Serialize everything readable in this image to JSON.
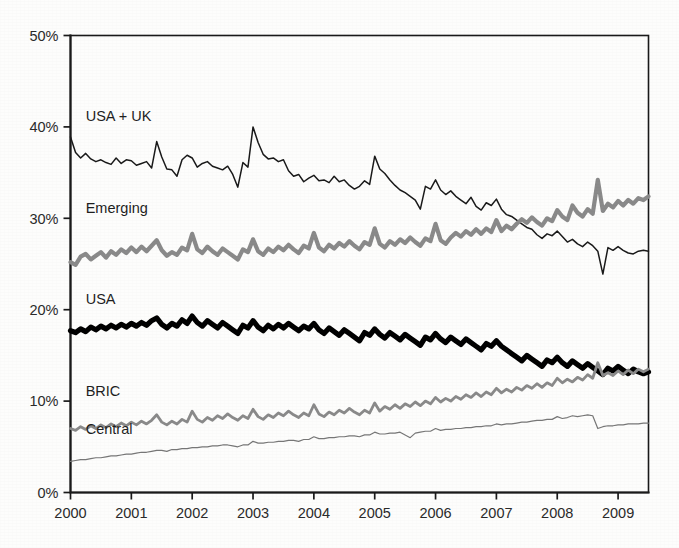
{
  "chart_data": {
    "type": "line",
    "title": "",
    "subtitle": "",
    "xlabel": "",
    "ylabel": "",
    "xlim": [
      2000.0,
      2009.5
    ],
    "ylim": [
      0,
      50
    ],
    "yunit": "%",
    "grid": false,
    "legend_position": "inline-left-labels",
    "y_ticks": [
      "0%",
      "10%",
      "20%",
      "30%",
      "40%",
      "50%"
    ],
    "y_tick_values": [
      0,
      10,
      20,
      30,
      40,
      50
    ],
    "x_ticks": [
      "2000",
      "2001",
      "2002",
      "2003",
      "2004",
      "2005",
      "2006",
      "2007",
      "2008",
      "2009"
    ],
    "x_tick_values": [
      2000,
      2001,
      2002,
      2003,
      2004,
      2005,
      2006,
      2007,
      2008,
      2009
    ],
    "series": [
      {
        "name": "USA + UK",
        "label": "USA + UK",
        "color": "#1a1a1a",
        "stroke_width": 1.5,
        "label_x": 2000.25,
        "label_y": 40.6,
        "values": [
          38.9,
          37.2,
          36.6,
          37.1,
          36.5,
          36.2,
          36.4,
          36.1,
          35.9,
          36.6,
          36.0,
          36.4,
          36.3,
          35.8,
          36.0,
          36.2,
          35.5,
          38.4,
          36.7,
          35.4,
          35.3,
          34.6,
          36.4,
          36.9,
          36.6,
          35.6,
          36.0,
          36.2,
          35.7,
          35.5,
          35.3,
          35.7,
          34.8,
          33.4,
          36.1,
          35.6,
          40.0,
          38.3,
          37.0,
          36.5,
          36.6,
          36.2,
          36.4,
          35.2,
          34.6,
          34.8,
          34.0,
          34.4,
          34.7,
          34.1,
          34.2,
          33.9,
          34.6,
          34.0,
          34.2,
          33.6,
          33.2,
          33.5,
          34.1,
          33.7,
          36.8,
          35.4,
          34.9,
          34.2,
          33.6,
          33.1,
          32.8,
          32.4,
          32.0,
          31.0,
          33.5,
          33.2,
          34.2,
          33.1,
          32.6,
          33.0,
          32.4,
          32.0,
          31.6,
          32.3,
          31.3,
          30.9,
          31.7,
          31.4,
          32.1,
          31.0,
          30.4,
          30.2,
          29.8,
          29.4,
          29.0,
          28.8,
          28.2,
          27.8,
          28.3,
          28.1,
          28.6,
          28.0,
          27.4,
          27.7,
          27.2,
          26.9,
          27.4,
          27.0,
          26.4,
          23.9,
          26.8,
          26.5,
          26.9,
          26.5,
          26.2,
          26.1,
          26.4,
          26.5,
          26.4
        ]
      },
      {
        "name": "Emerging",
        "label": "Emerging",
        "color": "#8a8a8a",
        "stroke_width": 4.2,
        "label_x": 2000.25,
        "label_y": 30.6,
        "values": [
          25.2,
          24.9,
          25.8,
          26.1,
          25.5,
          25.9,
          26.3,
          25.7,
          26.4,
          26.0,
          26.6,
          26.2,
          26.8,
          26.3,
          26.9,
          26.4,
          27.0,
          27.6,
          26.5,
          25.9,
          26.3,
          26.0,
          26.8,
          26.5,
          28.3,
          26.6,
          26.2,
          26.9,
          26.4,
          26.0,
          26.7,
          26.3,
          25.9,
          25.5,
          26.6,
          26.3,
          27.7,
          26.4,
          26.0,
          26.7,
          26.3,
          26.9,
          26.5,
          27.1,
          26.6,
          26.2,
          27.0,
          26.7,
          28.4,
          26.8,
          26.4,
          27.1,
          26.7,
          27.3,
          26.9,
          27.5,
          27.0,
          26.6,
          27.4,
          27.1,
          28.9,
          27.2,
          26.8,
          27.5,
          27.1,
          27.7,
          27.3,
          27.9,
          27.4,
          27.0,
          27.8,
          27.5,
          29.4,
          27.6,
          27.2,
          27.9,
          28.4,
          28.0,
          28.6,
          28.2,
          28.8,
          28.3,
          28.9,
          28.5,
          29.8,
          28.6,
          29.2,
          28.8,
          29.4,
          29.9,
          29.5,
          30.1,
          29.6,
          29.2,
          30.0,
          29.7,
          30.9,
          30.2,
          29.8,
          31.4,
          30.6,
          30.2,
          31.0,
          30.5,
          34.2,
          30.8,
          31.6,
          31.2,
          31.9,
          31.4,
          32.0,
          31.6,
          32.2,
          32.0,
          32.4
        ]
      },
      {
        "name": "USA",
        "label": "USA",
        "color": "#000000",
        "stroke_width": 5.2,
        "label_x": 2000.25,
        "label_y": 20.6,
        "values": [
          17.7,
          17.5,
          17.9,
          17.6,
          18.1,
          17.8,
          18.2,
          17.9,
          18.3,
          18.0,
          18.4,
          18.1,
          18.5,
          18.2,
          18.6,
          18.3,
          18.8,
          19.1,
          18.4,
          18.0,
          18.5,
          18.2,
          18.9,
          18.5,
          19.3,
          18.6,
          18.2,
          18.8,
          18.4,
          18.0,
          18.6,
          18.2,
          17.8,
          17.4,
          18.3,
          18.0,
          18.8,
          18.1,
          17.7,
          18.3,
          17.9,
          18.4,
          18.0,
          18.5,
          18.1,
          17.7,
          18.2,
          17.9,
          18.5,
          17.8,
          17.4,
          18.0,
          17.6,
          17.2,
          17.8,
          17.4,
          17.0,
          16.6,
          17.5,
          17.2,
          17.9,
          17.3,
          16.9,
          17.5,
          17.1,
          16.7,
          17.3,
          16.9,
          16.5,
          16.1,
          17.0,
          16.7,
          17.4,
          16.8,
          16.4,
          17.0,
          16.6,
          16.2,
          16.8,
          16.4,
          16.0,
          15.6,
          16.3,
          16.0,
          16.6,
          16.0,
          15.6,
          15.2,
          14.8,
          14.4,
          15.0,
          14.6,
          14.2,
          13.8,
          14.5,
          14.2,
          14.8,
          14.2,
          13.8,
          14.4,
          14.0,
          13.6,
          14.1,
          13.7,
          13.3,
          12.9,
          13.6,
          13.3,
          13.8,
          13.4,
          13.0,
          13.5,
          13.2,
          13.0,
          13.2
        ]
      },
      {
        "name": "BRIC",
        "label": "BRIC",
        "color": "#8a8a8a",
        "stroke_width": 2.8,
        "label_x": 2000.25,
        "label_y": 10.6,
        "values": [
          7.0,
          6.8,
          7.2,
          6.9,
          7.3,
          7.0,
          7.4,
          7.1,
          7.5,
          7.2,
          7.6,
          7.3,
          7.7,
          7.4,
          7.8,
          7.5,
          7.9,
          8.5,
          7.7,
          7.4,
          7.8,
          7.5,
          8.0,
          7.7,
          8.9,
          8.0,
          7.7,
          8.2,
          7.9,
          8.4,
          8.1,
          8.6,
          8.2,
          7.9,
          8.4,
          8.1,
          9.1,
          8.3,
          8.0,
          8.5,
          8.2,
          8.7,
          8.4,
          8.9,
          8.5,
          8.2,
          8.7,
          8.4,
          9.6,
          8.6,
          8.3,
          8.8,
          8.5,
          9.0,
          8.7,
          9.2,
          8.8,
          8.5,
          9.0,
          8.7,
          9.8,
          8.9,
          9.4,
          9.1,
          9.6,
          9.2,
          9.7,
          9.4,
          9.9,
          9.5,
          10.0,
          9.7,
          10.4,
          9.9,
          10.3,
          10.0,
          10.5,
          10.2,
          10.7,
          10.4,
          10.9,
          10.5,
          11.0,
          10.7,
          11.4,
          10.9,
          11.3,
          11.0,
          11.5,
          11.2,
          11.7,
          11.4,
          11.9,
          11.5,
          12.0,
          11.7,
          12.5,
          12.0,
          12.4,
          12.1,
          12.6,
          12.3,
          12.9,
          12.5,
          14.2,
          12.8,
          13.1,
          12.8,
          13.3,
          12.9,
          13.4,
          13.0,
          13.5,
          13.2,
          13.5
        ]
      },
      {
        "name": "Central",
        "label": "Central",
        "color": "#777777",
        "stroke_width": 1.2,
        "label_x": 2000.25,
        "label_y": 6.4,
        "values": [
          3.4,
          3.5,
          3.6,
          3.6,
          3.7,
          3.8,
          3.8,
          3.9,
          4.0,
          4.0,
          4.1,
          4.2,
          4.2,
          4.3,
          4.4,
          4.4,
          4.5,
          4.6,
          4.6,
          4.5,
          4.7,
          4.7,
          4.8,
          4.8,
          4.9,
          4.9,
          5.0,
          5.0,
          5.1,
          5.1,
          5.2,
          5.2,
          5.1,
          5.0,
          5.2,
          5.2,
          5.6,
          5.4,
          5.4,
          5.5,
          5.5,
          5.6,
          5.6,
          5.7,
          5.7,
          5.6,
          5.8,
          5.8,
          6.1,
          5.9,
          5.9,
          6.0,
          6.0,
          6.1,
          6.1,
          6.2,
          6.2,
          6.1,
          6.3,
          6.3,
          6.6,
          6.4,
          6.4,
          6.5,
          6.5,
          6.6,
          6.3,
          6.0,
          6.5,
          6.6,
          6.7,
          6.7,
          7.0,
          6.8,
          6.9,
          6.9,
          7.0,
          7.0,
          7.1,
          7.1,
          7.2,
          7.2,
          7.3,
          7.3,
          7.5,
          7.4,
          7.5,
          7.5,
          7.6,
          7.7,
          7.7,
          7.8,
          7.9,
          7.9,
          8.0,
          8.0,
          8.3,
          8.1,
          8.2,
          8.4,
          8.3,
          8.4,
          8.5,
          8.4,
          7.0,
          7.2,
          7.3,
          7.3,
          7.4,
          7.4,
          7.5,
          7.5,
          7.5,
          7.6,
          7.6
        ]
      }
    ]
  }
}
